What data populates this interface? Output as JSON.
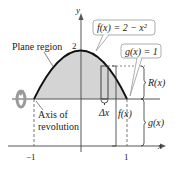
{
  "figure": {
    "y_axis_label": "y",
    "x_axis_label": "x",
    "tick_y_2": "2",
    "tick_x_neg1": "−1",
    "tick_x_1": "1",
    "plane_region_label": "Plane region",
    "axis_label_line1": "Axis of",
    "axis_label_line2": "revolution",
    "f_callout": "f(x) = 2 − x²",
    "g_callout": "g(x) = 1",
    "delta_x": "Δx",
    "f_bracket": "f(x)",
    "R_bracket": "R(x)",
    "g_bracket": "g(x)",
    "colors": {
      "region_fill": "#d4d4d4",
      "curve": "#111111",
      "axis": "#555555",
      "callout_border": "#999999",
      "rotation_icon": "#9a9a9a"
    }
  }
}
